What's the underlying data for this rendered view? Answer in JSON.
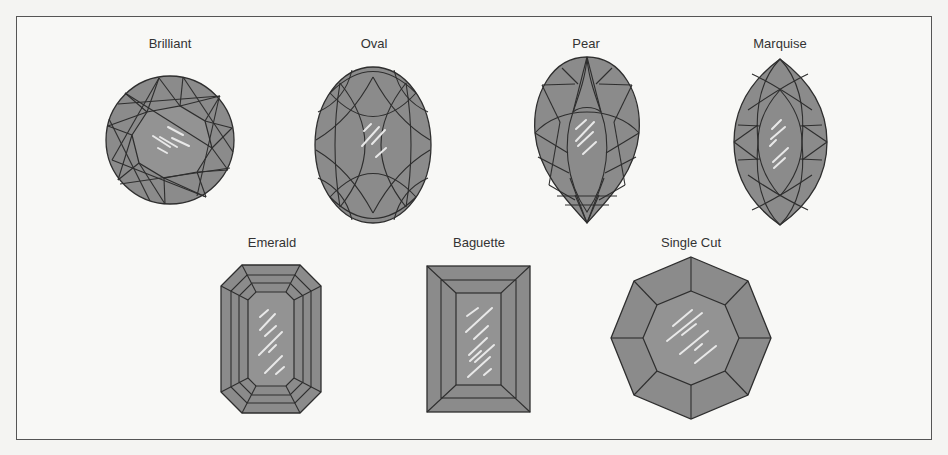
{
  "figure": {
    "colors": {
      "background": "#f8f8f6",
      "frame": "#555555",
      "gem_fill": "#8b8b8b",
      "table_fill": "#939393",
      "facet_line": "#2e2e2e",
      "shine": "#e8e8e8",
      "label_text": "#333333"
    },
    "top_row": [
      {
        "id": "brilliant",
        "label": "Brilliant",
        "shape": "round"
      },
      {
        "id": "oval",
        "label": "Oval",
        "shape": "oval"
      },
      {
        "id": "pear",
        "label": "Pear",
        "shape": "pear"
      },
      {
        "id": "marquise",
        "label": "Marquise",
        "shape": "marquise"
      }
    ],
    "bottom_row": [
      {
        "id": "emerald",
        "label": "Emerald",
        "shape": "octagonal-step"
      },
      {
        "id": "baguette",
        "label": "Baguette",
        "shape": "rectangular-step"
      },
      {
        "id": "single-cut",
        "label": "Single Cut",
        "shape": "octagon"
      }
    ]
  }
}
